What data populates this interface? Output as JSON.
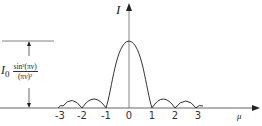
{
  "diagram": {
    "y_axis_label": "I",
    "x_axis_label": "μ",
    "tick_labels": [
      "-3",
      "-2",
      "-1",
      "0",
      "1",
      "2",
      "3"
    ],
    "dimension_label": {
      "prefix": "I",
      "subscript": "0",
      "numerator": "sin²(πν)",
      "denominator": "(πν)²"
    },
    "colors": {
      "line": "#333333",
      "background": "#ffffff"
    }
  }
}
